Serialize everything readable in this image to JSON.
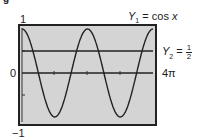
{
  "chart_data": {
    "type": "line",
    "title": "",
    "series": [
      {
        "name": "Y1 = cos x",
        "function": "cos x"
      },
      {
        "name": "Y2 = 1/2",
        "function": "1/2"
      }
    ],
    "x_range": [
      0,
      "4π"
    ],
    "ylim": [
      -1,
      1
    ],
    "tick_labels": {
      "y_top": "1",
      "y_zero": "0",
      "y_bottom": "−1",
      "x_right": "4π"
    },
    "grid": false,
    "background": "#d4d4d4"
  },
  "labels": {
    "y1_name": "Y",
    "y1_sub": "1",
    "y1_expr": " = cos ",
    "y1_var": "x",
    "y2_name": "Y",
    "y2_sub": "2",
    "y2_eq": " = ",
    "y2_num": "1",
    "y2_den": "2",
    "y_top": "1",
    "y_zero": "0",
    "y_bottom": "−1",
    "x_right": "4π",
    "corner": "g"
  }
}
